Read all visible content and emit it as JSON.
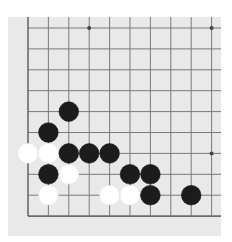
{
  "game": {
    "type": "go-board-fragment",
    "board": {
      "background": "#e9e9e9",
      "line_color": "#7a7a7a",
      "edge_line_color": "#6a6a6a",
      "columns": 10,
      "rows": 10,
      "origin_x": 20,
      "origin_y": 11,
      "spacing_x": 20.4,
      "spacing_y": 20.9,
      "edges": {
        "left": true,
        "bottom": true,
        "top": false,
        "right": false
      }
    },
    "star_points": [
      {
        "col": 3,
        "row": 0
      },
      {
        "col": 9,
        "row": 0
      },
      {
        "col": 9,
        "row": 6
      }
    ],
    "stones": [
      {
        "color": "black",
        "col": 2,
        "row": 4
      },
      {
        "color": "black",
        "col": 1,
        "row": 5
      },
      {
        "color": "white",
        "col": 0,
        "row": 6
      },
      {
        "color": "white",
        "col": 1,
        "row": 6
      },
      {
        "color": "black",
        "col": 2,
        "row": 6
      },
      {
        "color": "black",
        "col": 3,
        "row": 6
      },
      {
        "color": "black",
        "col": 4,
        "row": 6
      },
      {
        "color": "black",
        "col": 1,
        "row": 7
      },
      {
        "color": "white",
        "col": 2,
        "row": 7
      },
      {
        "color": "black",
        "col": 5,
        "row": 7
      },
      {
        "color": "black",
        "col": 6,
        "row": 7
      },
      {
        "color": "white",
        "col": 1,
        "row": 8
      },
      {
        "color": "white",
        "col": 4,
        "row": 8
      },
      {
        "color": "white",
        "col": 5,
        "row": 8
      },
      {
        "color": "black",
        "col": 6,
        "row": 8
      },
      {
        "color": "black",
        "col": 8,
        "row": 8
      }
    ],
    "stone_colors": {
      "black": "#1c1c1c",
      "white": "#ffffff"
    },
    "stone_radius": 9.8
  }
}
